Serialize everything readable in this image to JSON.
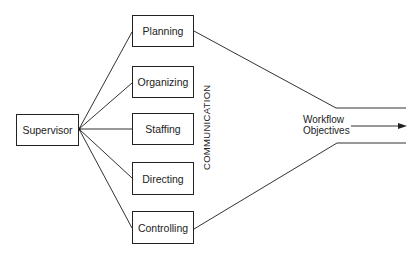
{
  "diagram": {
    "source": {
      "label": "Supervisor"
    },
    "functions": [
      {
        "label": "Planning"
      },
      {
        "label": "Organizing"
      },
      {
        "label": "Staffing"
      },
      {
        "label": "Directing"
      },
      {
        "label": "Controlling"
      }
    ],
    "channel_label": "COMMUNICATION",
    "output": {
      "line1": "Workflow",
      "line2": "Objectives"
    },
    "colors": {
      "stroke": "#222222",
      "background": "#ffffff"
    }
  }
}
